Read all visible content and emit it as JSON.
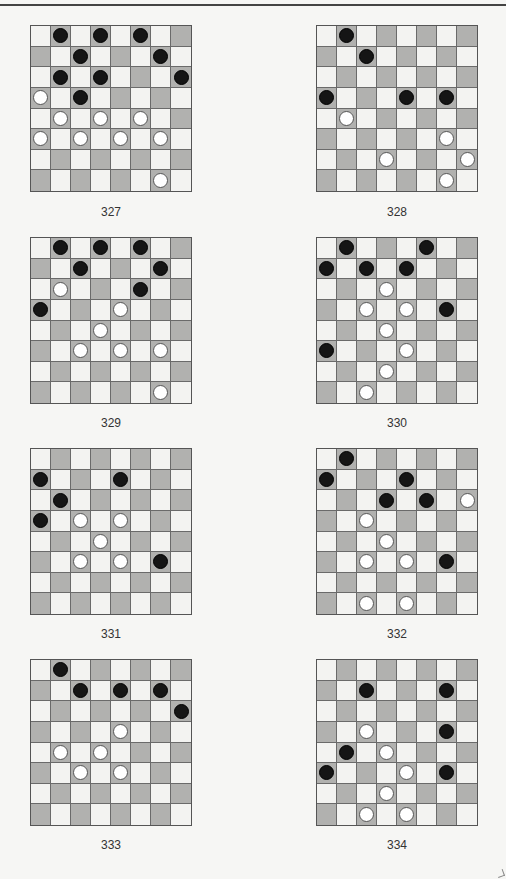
{
  "page": {
    "colors": {
      "light_square": "#f3f3f1",
      "dark_square": "#b1b1af",
      "black_piece": "#151515",
      "white_piece": "#ffffff"
    }
  },
  "diagrams": [
    {
      "number": "327",
      "black": [
        [
          0,
          1
        ],
        [
          0,
          3
        ],
        [
          0,
          5
        ],
        [
          1,
          2
        ],
        [
          1,
          6
        ],
        [
          2,
          1
        ],
        [
          2,
          3
        ],
        [
          2,
          7
        ],
        [
          3,
          2
        ]
      ],
      "white": [
        [
          3,
          0
        ],
        [
          4,
          1
        ],
        [
          4,
          3
        ],
        [
          4,
          5
        ],
        [
          5,
          0
        ],
        [
          5,
          2
        ],
        [
          5,
          4
        ],
        [
          5,
          6
        ],
        [
          7,
          6
        ]
      ]
    },
    {
      "number": "328",
      "black": [
        [
          0,
          1
        ],
        [
          1,
          2
        ],
        [
          3,
          0
        ],
        [
          3,
          4
        ],
        [
          3,
          6
        ]
      ],
      "white": [
        [
          4,
          1
        ],
        [
          5,
          6
        ],
        [
          6,
          3
        ],
        [
          6,
          7
        ],
        [
          7,
          6
        ]
      ]
    },
    {
      "number": "329",
      "black": [
        [
          0,
          1
        ],
        [
          0,
          3
        ],
        [
          0,
          5
        ],
        [
          1,
          2
        ],
        [
          1,
          6
        ],
        [
          2,
          5
        ],
        [
          3,
          0
        ]
      ],
      "white": [
        [
          2,
          1
        ],
        [
          3,
          4
        ],
        [
          4,
          3
        ],
        [
          5,
          2
        ],
        [
          5,
          4
        ],
        [
          5,
          6
        ],
        [
          7,
          6
        ]
      ]
    },
    {
      "number": "330",
      "black": [
        [
          0,
          1
        ],
        [
          0,
          5
        ],
        [
          1,
          0
        ],
        [
          1,
          2
        ],
        [
          1,
          4
        ],
        [
          3,
          6
        ],
        [
          5,
          0
        ]
      ],
      "white": [
        [
          2,
          3
        ],
        [
          3,
          2
        ],
        [
          3,
          4
        ],
        [
          4,
          3
        ],
        [
          5,
          4
        ],
        [
          6,
          3
        ],
        [
          7,
          2
        ]
      ]
    },
    {
      "number": "331",
      "black": [
        [
          1,
          0
        ],
        [
          1,
          4
        ],
        [
          2,
          1
        ],
        [
          3,
          0
        ],
        [
          5,
          6
        ]
      ],
      "white": [
        [
          3,
          2
        ],
        [
          3,
          4
        ],
        [
          4,
          3
        ],
        [
          5,
          2
        ],
        [
          5,
          4
        ]
      ]
    },
    {
      "number": "332",
      "black": [
        [
          0,
          1
        ],
        [
          1,
          0
        ],
        [
          1,
          4
        ],
        [
          2,
          3
        ],
        [
          2,
          5
        ],
        [
          5,
          6
        ]
      ],
      "white": [
        [
          2,
          7
        ],
        [
          3,
          2
        ],
        [
          4,
          3
        ],
        [
          5,
          2
        ],
        [
          5,
          4
        ],
        [
          7,
          2
        ],
        [
          7,
          4
        ]
      ]
    },
    {
      "number": "333",
      "black": [
        [
          0,
          1
        ],
        [
          1,
          2
        ],
        [
          1,
          4
        ],
        [
          1,
          6
        ],
        [
          2,
          7
        ]
      ],
      "white": [
        [
          3,
          4
        ],
        [
          4,
          1
        ],
        [
          4,
          3
        ],
        [
          5,
          2
        ],
        [
          5,
          4
        ]
      ]
    },
    {
      "number": "334",
      "black": [
        [
          1,
          2
        ],
        [
          1,
          6
        ],
        [
          3,
          6
        ],
        [
          4,
          1
        ],
        [
          5,
          0
        ],
        [
          5,
          6
        ]
      ],
      "white": [
        [
          3,
          2
        ],
        [
          4,
          3
        ],
        [
          5,
          4
        ],
        [
          6,
          3
        ],
        [
          7,
          2
        ],
        [
          7,
          4
        ]
      ]
    }
  ]
}
